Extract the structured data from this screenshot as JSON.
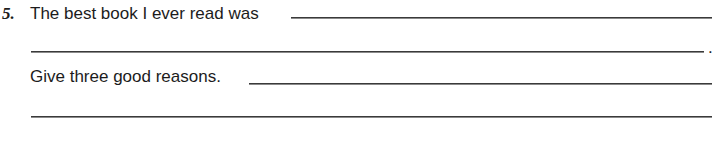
{
  "question": {
    "number": "5.",
    "prompt": "The best book I ever read was",
    "end_punctuation": ".",
    "follow_up": "Give three good reasons."
  },
  "answer_lines": [
    {
      "id": "book-title-line-1",
      "value": ""
    },
    {
      "id": "book-title-line-2",
      "value": ""
    },
    {
      "id": "reasons-line-1",
      "value": ""
    },
    {
      "id": "reasons-line-2",
      "value": ""
    }
  ]
}
